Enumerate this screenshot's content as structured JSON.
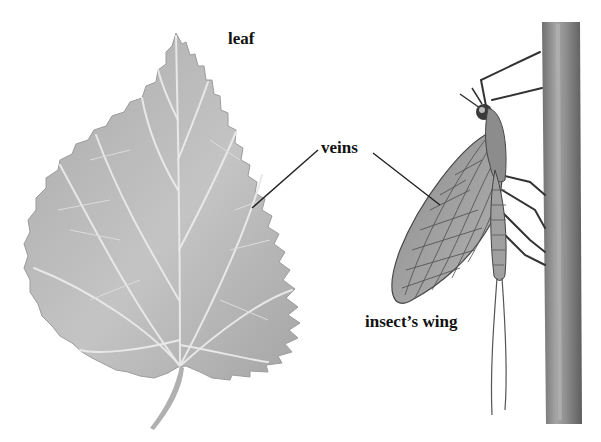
{
  "diagram": {
    "labels": {
      "leaf": "leaf",
      "veins": "veins",
      "wing": "insect’s wing"
    },
    "colors": {
      "leaf_fill": "#b9b9b9",
      "leaf_vein": "#e6e6e6",
      "stem_fill": "#8a8a8a",
      "wing_fill": "#9a9a9a",
      "wing_vein": "#555555",
      "pointer": "#222222",
      "text": "#111111"
    }
  }
}
